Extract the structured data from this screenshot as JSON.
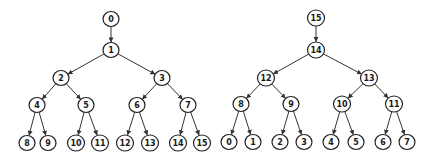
{
  "colors": {
    "edge": "#333333",
    "node_stroke": "#222222",
    "node_fill": "#ffffff",
    "text": "#1a1a1a"
  },
  "trees": [
    {
      "name": "left-tree",
      "nodes": [
        {
          "id": "0",
          "x": 111,
          "y": 19,
          "r": 7.5
        },
        {
          "id": "1",
          "x": 111,
          "y": 50,
          "r": 7.5
        },
        {
          "id": "2",
          "x": 61,
          "y": 78,
          "r": 7.5
        },
        {
          "id": "3",
          "x": 162,
          "y": 78,
          "r": 7.5
        },
        {
          "id": "4",
          "x": 37,
          "y": 105,
          "r": 7.5
        },
        {
          "id": "5",
          "x": 86,
          "y": 105,
          "r": 7.5
        },
        {
          "id": "6",
          "x": 137,
          "y": 105,
          "r": 7.5
        },
        {
          "id": "7",
          "x": 188,
          "y": 105,
          "r": 7.5
        },
        {
          "id": "8",
          "x": 27,
          "y": 143,
          "r": 7.5
        },
        {
          "id": "9",
          "x": 48,
          "y": 143,
          "r": 7.5
        },
        {
          "id": "10",
          "x": 76,
          "y": 143,
          "r": 8
        },
        {
          "id": "11",
          "x": 100,
          "y": 143,
          "r": 8
        },
        {
          "id": "12",
          "x": 125,
          "y": 143,
          "r": 8
        },
        {
          "id": "13",
          "x": 150,
          "y": 143,
          "r": 8
        },
        {
          "id": "14",
          "x": 178,
          "y": 143,
          "r": 8
        },
        {
          "id": "15",
          "x": 202,
          "y": 143,
          "r": 8
        }
      ],
      "edges": [
        [
          "0",
          "1"
        ],
        [
          "1",
          "2"
        ],
        [
          "1",
          "3"
        ],
        [
          "2",
          "4"
        ],
        [
          "2",
          "5"
        ],
        [
          "3",
          "6"
        ],
        [
          "3",
          "7"
        ],
        [
          "4",
          "8"
        ],
        [
          "4",
          "9"
        ],
        [
          "5",
          "10"
        ],
        [
          "5",
          "11"
        ],
        [
          "6",
          "12"
        ],
        [
          "6",
          "13"
        ],
        [
          "7",
          "14"
        ],
        [
          "7",
          "15"
        ]
      ]
    },
    {
      "name": "right-tree",
      "nodes": [
        {
          "id": "15",
          "x": 316,
          "y": 18,
          "r": 8
        },
        {
          "id": "14",
          "x": 316,
          "y": 50,
          "r": 8
        },
        {
          "id": "12",
          "x": 266,
          "y": 78,
          "r": 8
        },
        {
          "id": "13",
          "x": 369,
          "y": 78,
          "r": 8
        },
        {
          "id": "8",
          "x": 241,
          "y": 104,
          "r": 7.5
        },
        {
          "id": "9",
          "x": 291,
          "y": 104,
          "r": 7.5
        },
        {
          "id": "10",
          "x": 342,
          "y": 104,
          "r": 8
        },
        {
          "id": "11",
          "x": 394,
          "y": 104,
          "r": 8
        },
        {
          "id": "0",
          "x": 229,
          "y": 142,
          "r": 7.5
        },
        {
          "id": "1",
          "x": 253,
          "y": 142,
          "r": 7.5
        },
        {
          "id": "2",
          "x": 280,
          "y": 142,
          "r": 7.5
        },
        {
          "id": "3",
          "x": 304,
          "y": 142,
          "r": 7.5
        },
        {
          "id": "4",
          "x": 331,
          "y": 142,
          "r": 7.5
        },
        {
          "id": "5",
          "x": 356,
          "y": 142,
          "r": 7.5
        },
        {
          "id": "6",
          "x": 383,
          "y": 142,
          "r": 7.5
        },
        {
          "id": "7",
          "x": 407,
          "y": 142,
          "r": 7.5
        }
      ],
      "edges": [
        [
          "15",
          "14"
        ],
        [
          "14",
          "12"
        ],
        [
          "14",
          "13"
        ],
        [
          "12",
          "8"
        ],
        [
          "12",
          "9"
        ],
        [
          "13",
          "10"
        ],
        [
          "13",
          "11"
        ],
        [
          "8",
          "0"
        ],
        [
          "8",
          "1"
        ],
        [
          "9",
          "2"
        ],
        [
          "9",
          "3"
        ],
        [
          "10",
          "4"
        ],
        [
          "10",
          "5"
        ],
        [
          "11",
          "6"
        ],
        [
          "11",
          "7"
        ]
      ]
    }
  ]
}
